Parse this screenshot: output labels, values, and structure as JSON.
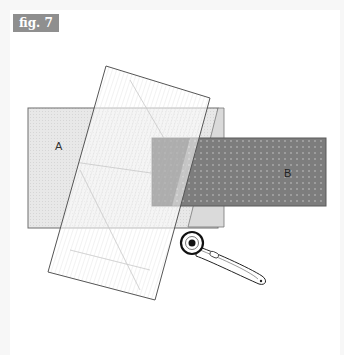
{
  "figure": {
    "label": "fig. 7",
    "label_bg": "#8f8f8f",
    "label_color": "#ffffff"
  },
  "pieces": {
    "a": {
      "label": "A",
      "fill": "#e6e6e6",
      "stroke": "#6e6e6e"
    },
    "b": {
      "label": "B",
      "fill": "#7d7d7d",
      "dot_color": "#a8a8a8",
      "stroke": "#5a5a5a"
    },
    "ruler": {
      "stroke": "#555555",
      "line_color": "#d4d4d4"
    },
    "wedge": {
      "fill": "#d8d8d8",
      "stroke": "#777777"
    },
    "cutter": {
      "stroke": "#222222",
      "fill": "#ffffff"
    }
  }
}
